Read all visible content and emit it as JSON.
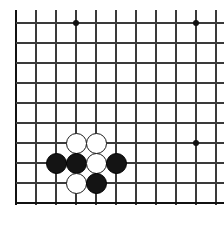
{
  "diagram": {
    "kind": "go-board-diagram",
    "board": {
      "cell_size": 20,
      "origin_x": 16,
      "origin_y": 23,
      "columns": 11,
      "rows": 10,
      "line_color": "#3a3a3a",
      "edge_color": "#111111",
      "background_color": "#ffffff",
      "cropped_edges": [
        "top",
        "right"
      ],
      "border_edges": [
        "left",
        "bottom"
      ]
    },
    "vertical_lines": [
      {
        "index": 0,
        "x": 16,
        "y1": 10,
        "y2": 205,
        "edge": true
      },
      {
        "index": 1,
        "x": 36,
        "y1": 10,
        "y2": 205,
        "edge": false
      },
      {
        "index": 2,
        "x": 56,
        "y1": 10,
        "y2": 205,
        "edge": false
      },
      {
        "index": 3,
        "x": 76,
        "y1": 10,
        "y2": 205,
        "edge": false
      },
      {
        "index": 4,
        "x": 96,
        "y1": 10,
        "y2": 205,
        "edge": false
      },
      {
        "index": 5,
        "x": 116,
        "y1": 10,
        "y2": 205,
        "edge": false
      },
      {
        "index": 6,
        "x": 136,
        "y1": 10,
        "y2": 205,
        "edge": false
      },
      {
        "index": 7,
        "x": 156,
        "y1": 10,
        "y2": 205,
        "edge": false
      },
      {
        "index": 8,
        "x": 176,
        "y1": 10,
        "y2": 205,
        "edge": false
      },
      {
        "index": 9,
        "x": 196,
        "y1": 10,
        "y2": 205,
        "edge": false
      },
      {
        "index": 10,
        "x": 216,
        "y1": 10,
        "y2": 205,
        "edge": false
      }
    ],
    "horizontal_lines": [
      {
        "index": 0,
        "y": 23,
        "x1": 16,
        "x2": 224,
        "edge": false
      },
      {
        "index": 1,
        "y": 43,
        "x1": 16,
        "x2": 224,
        "edge": false
      },
      {
        "index": 2,
        "y": 63,
        "x1": 16,
        "x2": 224,
        "edge": false
      },
      {
        "index": 3,
        "y": 83,
        "x1": 16,
        "x2": 224,
        "edge": false
      },
      {
        "index": 4,
        "y": 103,
        "x1": 16,
        "x2": 224,
        "edge": false
      },
      {
        "index": 5,
        "y": 123,
        "x1": 16,
        "x2": 224,
        "edge": false
      },
      {
        "index": 6,
        "y": 143,
        "x1": 16,
        "x2": 224,
        "edge": false
      },
      {
        "index": 7,
        "y": 163,
        "x1": 16,
        "x2": 224,
        "edge": false
      },
      {
        "index": 8,
        "y": 183,
        "x1": 16,
        "x2": 224,
        "edge": false
      },
      {
        "index": 9,
        "y": 203,
        "x1": 16,
        "x2": 224,
        "edge": true
      }
    ],
    "star_points": [
      {
        "col": 3,
        "row": 0,
        "x": 76,
        "y": 23
      },
      {
        "col": 9,
        "row": 0,
        "x": 196,
        "y": 23
      },
      {
        "col": 9,
        "row": 6,
        "x": 196,
        "y": 143
      }
    ],
    "stones": [
      {
        "color": "white",
        "col": 3,
        "row": 6,
        "x": 76,
        "y": 143
      },
      {
        "color": "white",
        "col": 4,
        "row": 6,
        "x": 96,
        "y": 143
      },
      {
        "color": "black",
        "col": 2,
        "row": 7,
        "x": 56,
        "y": 163
      },
      {
        "color": "black",
        "col": 3,
        "row": 7,
        "x": 76,
        "y": 163
      },
      {
        "color": "white",
        "col": 4,
        "row": 7,
        "x": 96,
        "y": 163
      },
      {
        "color": "black",
        "col": 5,
        "row": 7,
        "x": 116,
        "y": 163
      },
      {
        "color": "white",
        "col": 3,
        "row": 8,
        "x": 76,
        "y": 183
      },
      {
        "color": "black",
        "col": 4,
        "row": 8,
        "x": 96,
        "y": 183
      }
    ],
    "stone_counts": {
      "black": 4,
      "white": 4,
      "total": 8
    },
    "colors": {
      "black_stone": "#141414",
      "white_stone": "#ffffff",
      "white_stone_outline": "#1a1a1a",
      "grid": "#3a3a3a",
      "border": "#111111",
      "hoshi": "#111111"
    }
  }
}
